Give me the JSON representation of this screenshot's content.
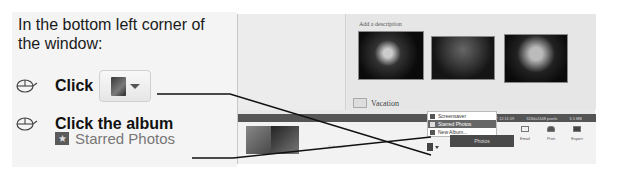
{
  "instructions": {
    "intro": "In the bottom left corner of the window:",
    "steps": [
      {
        "icon": "mouse-click-icon",
        "label": "Click",
        "target_icon": "album-dropdown-button"
      },
      {
        "icon": "mouse-click-icon",
        "label": "Click the album",
        "sub_label": "Starred Photos",
        "sub_icon": "starred-album-icon"
      }
    ]
  },
  "app": {
    "description_placeholder": "Add a description",
    "folder_name": "Vacation",
    "selection_label": "Selection",
    "info_bar": {
      "filename": "Snow.jpg",
      "date": "27-12-2007 12:11:59",
      "dimensions": "3264x2448 pixels",
      "size": "3.5 MB"
    },
    "album_menu": {
      "items": [
        {
          "label": "Screensaver",
          "selected": false
        },
        {
          "label": "Starred Photos",
          "selected": true
        },
        {
          "label": "New Album...",
          "selected": false
        }
      ]
    },
    "photos_button": "Photos",
    "tools": [
      {
        "label": "Email",
        "icon": "email-icon"
      },
      {
        "label": "Print",
        "icon": "print-icon"
      },
      {
        "label": "Export",
        "icon": "export-icon"
      }
    ]
  },
  "colors": {
    "panel_bg": "#f4f4f4",
    "infobar_bg": "#555555",
    "menu_selected": "#666666",
    "callout_line": "#111111"
  }
}
